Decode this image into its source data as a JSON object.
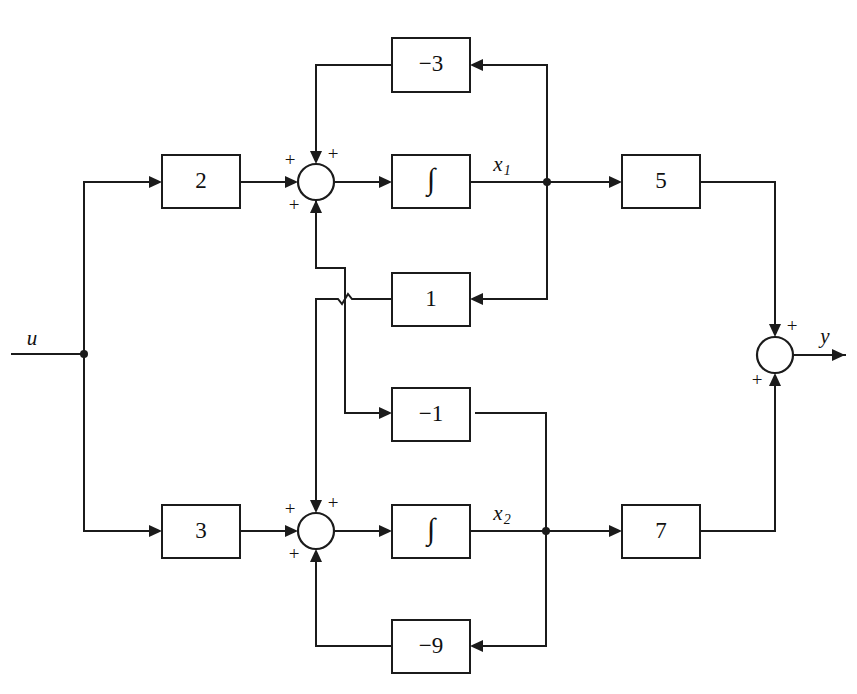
{
  "diagram": {
    "stroke_color": "#1b1b1b",
    "background_color": "#ffffff",
    "signals": {
      "input": "u",
      "output": "y",
      "state1": "x",
      "state1_sub": "1",
      "state2": "x",
      "state2_sub": "2"
    },
    "blocks": [
      {
        "id": "gain-neg3",
        "label": "−3",
        "x": 392,
        "y": 38,
        "w": 78,
        "h": 54
      },
      {
        "id": "gain-2",
        "label": "2",
        "x": 162,
        "y": 155,
        "w": 78,
        "h": 53
      },
      {
        "id": "integ-1",
        "label": "∫",
        "x": 392,
        "y": 155,
        "w": 78,
        "h": 53
      },
      {
        "id": "gain-5",
        "label": "5",
        "x": 622,
        "y": 155,
        "w": 78,
        "h": 53
      },
      {
        "id": "gain-1",
        "label": "1",
        "x": 392,
        "y": 273,
        "w": 78,
        "h": 53
      },
      {
        "id": "gain-neg1",
        "label": "−1",
        "x": 392,
        "y": 388,
        "w": 78,
        "h": 53
      },
      {
        "id": "gain-3",
        "label": "3",
        "x": 162,
        "y": 505,
        "w": 78,
        "h": 53
      },
      {
        "id": "integ-2",
        "label": "∫",
        "x": 392,
        "y": 505,
        "w": 78,
        "h": 53
      },
      {
        "id": "gain-7",
        "label": "7",
        "x": 622,
        "y": 505,
        "w": 78,
        "h": 53
      },
      {
        "id": "gain-neg9",
        "label": "−9",
        "x": 392,
        "y": 620,
        "w": 78,
        "h": 53
      }
    ],
    "summers": [
      {
        "id": "summer-top",
        "cx": 316,
        "cy": 182,
        "r": 18,
        "signs": [
          {
            "label": "+",
            "x": 290,
            "y": 162
          },
          {
            "label": "+",
            "x": 333,
            "y": 156
          },
          {
            "label": "+",
            "x": 294,
            "y": 207
          }
        ]
      },
      {
        "id": "summer-bottom",
        "cx": 316,
        "cy": 531,
        "r": 18,
        "signs": [
          {
            "label": "+",
            "x": 290,
            "y": 511
          },
          {
            "label": "+",
            "x": 333,
            "y": 505
          },
          {
            "label": "+",
            "x": 294,
            "y": 556
          }
        ]
      },
      {
        "id": "summer-output",
        "cx": 775,
        "cy": 355,
        "r": 18,
        "signs": [
          {
            "label": "+",
            "x": 792,
            "y": 328
          },
          {
            "label": "+",
            "x": 757,
            "y": 382
          }
        ]
      }
    ],
    "junction_dots": [
      {
        "id": "dot-u",
        "cx": 84,
        "cy": 354,
        "r": 4
      },
      {
        "id": "dot-x1",
        "cx": 547,
        "cy": 182,
        "r": 4
      },
      {
        "id": "dot-x2",
        "cx": 546,
        "cy": 531,
        "r": 4
      }
    ],
    "labels": [
      {
        "id": "label-u",
        "text": "u",
        "x": 32,
        "y": 340
      },
      {
        "id": "label-y",
        "text": "y",
        "x": 825,
        "y": 338
      },
      {
        "id": "label-x1",
        "text": "x",
        "sub": "1",
        "x": 502,
        "y": 166
      },
      {
        "id": "label-x2",
        "text": "x",
        "sub": "2",
        "x": 502,
        "y": 515
      }
    ],
    "wire_paths": [
      {
        "id": "wire-u-in",
        "d": "M 12 354 L 84 354"
      },
      {
        "id": "wire-u-up-to-gain2",
        "d": "M 84 354 L 84 182 L 156 182"
      },
      {
        "id": "wire-u-down-to-gain3",
        "d": "M 84 354 L 84 531 L 156 531"
      },
      {
        "id": "wire-gain2-to-summer",
        "d": "M 240 182 L 292 182"
      },
      {
        "id": "wire-summer1-to-integ",
        "d": "M 334 182 L 386 182"
      },
      {
        "id": "wire-integ1-to-x1",
        "d": "M 470 182 L 547 182"
      },
      {
        "id": "wire-x1-to-gain5",
        "d": "M 547 182 L 616 182"
      },
      {
        "id": "wire-x1-up-to-neg3",
        "d": "M 547 182 L 547 65 L 476 65"
      },
      {
        "id": "wire-neg3-out",
        "d": "M 392 65 L 316 65 L 316 158"
      },
      {
        "id": "wire-x1-down-to-gain1",
        "d": "M 547 182 L 547 299 L 476 299"
      },
      {
        "id": "wire-gain1-out-hop",
        "d": "M 392 299 L 352 299 L 348 294 L 342 304 L 338 299 L 316 299 L 316 504"
      },
      {
        "id": "wire-summer1-bottom-down",
        "d": "M 316 200 L 316 268 L 345 268 L 345 413 L 386 413"
      },
      {
        "id": "wire-x2-up-to-neg1",
        "d": "M 546 531 L 546 413 L 476 413"
      },
      {
        "id": "wire-gain3-to-summer",
        "d": "M 240 531 L 292 531"
      },
      {
        "id": "wire-summer2-to-integ",
        "d": "M 334 531 L 386 531"
      },
      {
        "id": "wire-integ2-to-x2",
        "d": "M 470 531 L 546 531"
      },
      {
        "id": "wire-x2-to-gain7",
        "d": "M 546 531 L 616 531"
      },
      {
        "id": "wire-x2-down-to-neg9",
        "d": "M 546 531 L 546 646 L 476 646"
      },
      {
        "id": "wire-neg9-out",
        "d": "M 392 646 L 316 646 L 316 556"
      },
      {
        "id": "wire-gain5-to-summer3",
        "d": "M 700 182 L 775 182 L 775 331"
      },
      {
        "id": "wire-gain7-to-summer3",
        "d": "M 700 531 L 775 531 L 775 379"
      },
      {
        "id": "wire-summer3-to-y",
        "d": "M 793 355 L 845 355"
      }
    ],
    "arrowheads": [
      {
        "id": "arrow-into-gain2",
        "x": 162,
        "y": 182,
        "dir": "right"
      },
      {
        "id": "arrow-into-sum1-l",
        "x": 298,
        "y": 182,
        "dir": "right"
      },
      {
        "id": "arrow-into-integ1",
        "x": 392,
        "y": 182,
        "dir": "right"
      },
      {
        "id": "arrow-into-gain5",
        "x": 622,
        "y": 182,
        "dir": "right"
      },
      {
        "id": "arrow-into-neg3",
        "x": 470,
        "y": 65,
        "dir": "left"
      },
      {
        "id": "arrow-into-sum1-t",
        "x": 316,
        "y": 164,
        "dir": "down"
      },
      {
        "id": "arrow-into-gain1",
        "x": 470,
        "y": 299,
        "dir": "left"
      },
      {
        "id": "arrow-into-sum1-b",
        "x": 316,
        "y": 200,
        "dir": "up"
      },
      {
        "id": "arrow-into-neg1",
        "x": 392,
        "y": 413,
        "dir": "right"
      },
      {
        "id": "arrow-into-gain3",
        "x": 162,
        "y": 531,
        "dir": "right"
      },
      {
        "id": "arrow-into-sum2-l",
        "x": 298,
        "y": 531,
        "dir": "right"
      },
      {
        "id": "arrow-into-integ2",
        "x": 392,
        "y": 531,
        "dir": "right"
      },
      {
        "id": "arrow-into-gain7",
        "x": 622,
        "y": 531,
        "dir": "right"
      },
      {
        "id": "arrow-into-sum2-t",
        "x": 316,
        "y": 513,
        "dir": "down"
      },
      {
        "id": "arrow-into-neg9",
        "x": 470,
        "y": 646,
        "dir": "left"
      },
      {
        "id": "arrow-into-sum2-b",
        "x": 316,
        "y": 549,
        "dir": "up"
      },
      {
        "id": "arrow-into-sum3-t",
        "x": 775,
        "y": 337,
        "dir": "down"
      },
      {
        "id": "arrow-into-sum3-b",
        "x": 775,
        "y": 373,
        "dir": "up"
      },
      {
        "id": "arrow-out-y",
        "x": 845,
        "y": 355,
        "dir": "right"
      }
    ]
  }
}
